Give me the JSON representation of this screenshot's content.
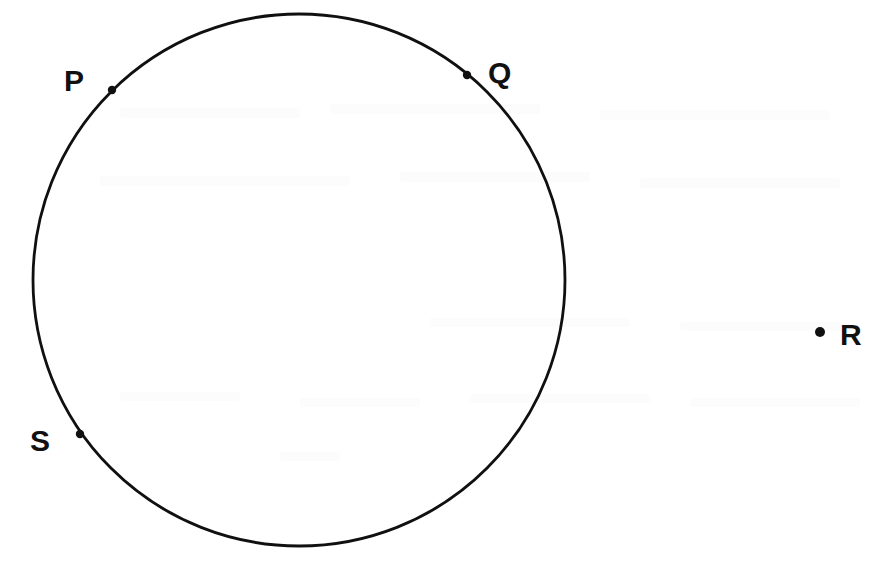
{
  "figure": {
    "background_color": "#ffffff",
    "ink_color": "#101010",
    "canvas": {
      "width": 878,
      "height": 561
    }
  },
  "circle": {
    "name": "main-circle",
    "center_x": 299,
    "center_y": 280,
    "radius": 266,
    "stroke_width": 2.8,
    "stroke_color": "#101010",
    "fill": "none"
  },
  "points": [
    {
      "id": "P",
      "label": "P",
      "dot_x": 112,
      "dot_y": 90,
      "dot_radius": 4,
      "label_x": 62,
      "label_y": 90,
      "position": "on-circle",
      "label_side": "left"
    },
    {
      "id": "Q",
      "label": "Q",
      "dot_x": 467,
      "dot_y": 75,
      "dot_radius": 4,
      "label_x": 488,
      "label_y": 82,
      "position": "on-circle",
      "label_side": "right"
    },
    {
      "id": "R",
      "label": "R",
      "dot_x": 820,
      "dot_y": 332,
      "dot_radius": 5,
      "label_x": 840,
      "label_y": 345,
      "position": "outside-circle",
      "label_side": "right"
    },
    {
      "id": "S",
      "label": "S",
      "dot_x": 80,
      "dot_y": 434,
      "dot_radius": 4,
      "label_x": 28,
      "label_y": 450,
      "position": "on-circle",
      "label_side": "left"
    }
  ]
}
